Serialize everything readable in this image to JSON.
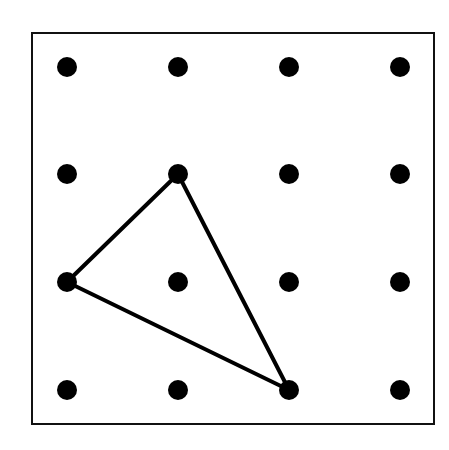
{
  "diagram": {
    "type": "geoboard-dot-grid",
    "grid": {
      "rows": 4,
      "cols": 4
    },
    "frame": {
      "x": 32,
      "y": 33,
      "width": 402,
      "height": 391,
      "stroke": "#111111"
    },
    "dot_x": [
      67,
      178,
      289,
      400
    ],
    "dot_y": [
      67,
      174,
      282,
      390
    ],
    "dot_radius": 10,
    "dot_color": "#000000",
    "triangle": {
      "vertices_grid": [
        [
          1,
          1
        ],
        [
          0,
          2
        ],
        [
          2,
          3
        ]
      ],
      "stroke": "#000000",
      "stroke_width": 4
    }
  }
}
